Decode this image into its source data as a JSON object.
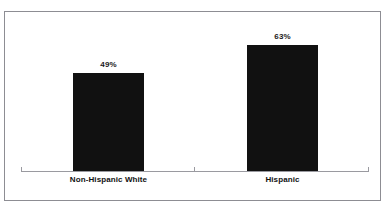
{
  "chart_data": {
    "type": "bar",
    "title": "",
    "xlabel": "",
    "ylabel": "",
    "categories": [
      "Non-Hispanic White",
      "Hispanic"
    ],
    "values": [
      49,
      63
    ],
    "value_labels": [
      "49%",
      "63%"
    ],
    "ylim": [
      0,
      100
    ],
    "grid": false,
    "legend": "none",
    "units": "percent",
    "bar_color": "#111111",
    "axis_color": "#9a9aa0",
    "border_color": "#8d8d93",
    "background_color": "#ffffff"
  },
  "chart": {
    "bars": [
      {
        "category": "Non-Hispanic White",
        "value_label": "49%"
      },
      {
        "category": "Hispanic",
        "value_label": "63%"
      }
    ],
    "title_remnant": ""
  }
}
